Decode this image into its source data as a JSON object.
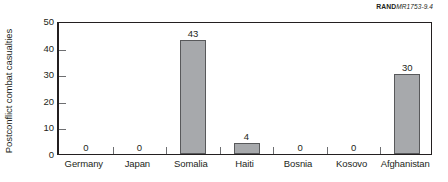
{
  "credit": {
    "brand": "RAND",
    "report_id": "MR1753-9.4"
  },
  "chart_data": {
    "type": "bar",
    "title": "",
    "xlabel": "",
    "ylabel": "Postconflict combat casualties",
    "categories": [
      "Germany",
      "Japan",
      "Somalia",
      "Haiti",
      "Bosnia",
      "Kosovo",
      "Afghanistan"
    ],
    "values": [
      0,
      0,
      43,
      4,
      0,
      0,
      30
    ],
    "value_labels": [
      "0",
      "0",
      "43",
      "4",
      "0",
      "0",
      "30"
    ],
    "ylim": [
      0,
      50
    ],
    "yticks": [
      0,
      10,
      20,
      30,
      40,
      50
    ],
    "ytick_labels": [
      "0",
      "10",
      "20",
      "30",
      "40",
      "50"
    ],
    "grid": false,
    "legend": "none",
    "bar_color": "#a7a9ac",
    "bar_edge_color": "#58595b",
    "axis_color": "#231f20",
    "background": "#ffffff"
  }
}
